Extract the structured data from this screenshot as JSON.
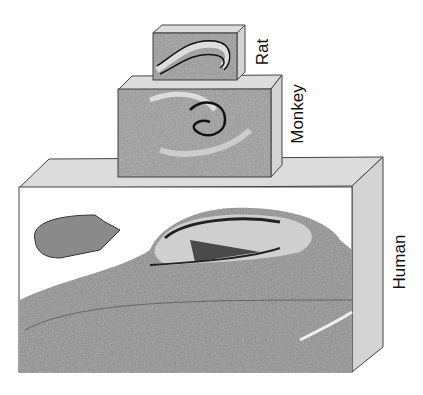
{
  "figure": {
    "title_partial": "",
    "specimens": [
      {
        "label": "Rat",
        "structure": "hippocampus section"
      },
      {
        "label": "Monkey",
        "structure": "hippocampus section"
      },
      {
        "label": "Human",
        "structure": "hippocampus section"
      }
    ]
  },
  "colors": {
    "box_side": "#d4d4d4",
    "box_top": "#dcdcdc",
    "tissue": "#8a8a8a",
    "tissue_dark": "#3a3a3a",
    "outline": "#444444"
  }
}
